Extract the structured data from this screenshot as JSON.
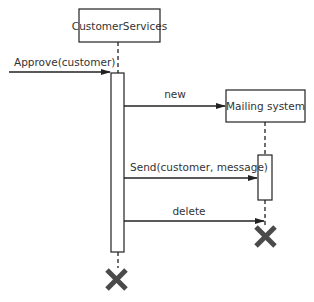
{
  "diagram": {
    "type": "UML sequence diagram",
    "lifelines": [
      {
        "name": "CustomerServices"
      },
      {
        "name": "Mailing system"
      }
    ],
    "messages": [
      {
        "label": "Approve(customer)",
        "from": "external",
        "to": "CustomerServices"
      },
      {
        "label": "new",
        "from": "CustomerServices",
        "to": "Mailing system"
      },
      {
        "label": "Send(customer, message)",
        "from": "CustomerServices",
        "to": "Mailing system"
      },
      {
        "label": "delete",
        "from": "CustomerServices",
        "to": "Mailing system"
      }
    ],
    "colors": {
      "line": "#222222",
      "destroy": "#4a4a4a",
      "text": "#333333"
    }
  }
}
